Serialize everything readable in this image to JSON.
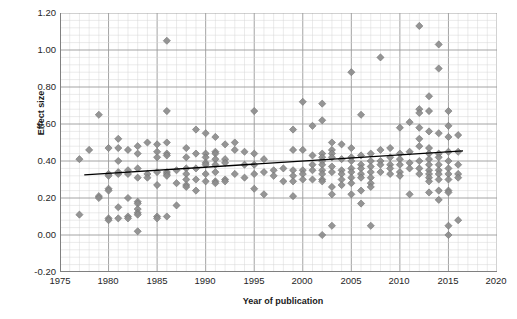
{
  "axes": {
    "x_title": "Year of publication",
    "y_title": "Effect size",
    "x_ticks": [
      "1975",
      "1980",
      "1985",
      "1990",
      "1995",
      "2000",
      "2005",
      "2010",
      "2015",
      "2020"
    ],
    "y_ticks": [
      "1.20",
      "1.00",
      "0.80",
      "0.60",
      "0.40",
      "0.20",
      "0.00",
      "-0.20"
    ]
  },
  "caption": {
    "partial_text": ""
  },
  "style": {
    "marker_color": "#8c8c8c",
    "marker_edge": "#737373",
    "trendline_color": "#000000",
    "major_grid_color": "#9a9a9a",
    "minor_grid_color": "#d6d6d6",
    "axis_color": "#808080"
  },
  "chart_data": {
    "type": "scatter",
    "title": "",
    "xlabel": "Year of publication",
    "ylabel": "Effect size",
    "xlim": [
      1975,
      2020
    ],
    "ylim": [
      -0.2,
      1.2
    ],
    "x_tick_step": 5,
    "y_tick_step": 0.2,
    "minor_grid": true,
    "grid": true,
    "legend": "none",
    "marker": "diamond",
    "series": [
      {
        "name": "Studies",
        "points": [
          [
            1977,
            0.41
          ],
          [
            1977,
            0.11
          ],
          [
            1978,
            0.46
          ],
          [
            1979,
            0.65
          ],
          [
            1979,
            0.21
          ],
          [
            1979,
            0.2
          ],
          [
            1980,
            0.47
          ],
          [
            1980,
            0.33
          ],
          [
            1980,
            0.32
          ],
          [
            1980,
            0.25
          ],
          [
            1980,
            0.24
          ],
          [
            1980,
            0.09
          ],
          [
            1980,
            0.08
          ],
          [
            1981,
            0.52
          ],
          [
            1981,
            0.47
          ],
          [
            1981,
            0.4
          ],
          [
            1981,
            0.34
          ],
          [
            1981,
            0.33
          ],
          [
            1981,
            0.15
          ],
          [
            1981,
            0.09
          ],
          [
            1982,
            0.46
          ],
          [
            1982,
            0.35
          ],
          [
            1982,
            0.33
          ],
          [
            1982,
            0.2
          ],
          [
            1982,
            0.1
          ],
          [
            1982,
            0.09
          ],
          [
            1983,
            0.48
          ],
          [
            1983,
            0.44
          ],
          [
            1983,
            0.36
          ],
          [
            1983,
            0.31
          ],
          [
            1983,
            0.18
          ],
          [
            1983,
            0.17
          ],
          [
            1983,
            0.14
          ],
          [
            1983,
            0.12
          ],
          [
            1983,
            0.11
          ],
          [
            1983,
            0.02
          ],
          [
            1984,
            0.5
          ],
          [
            1984,
            0.33
          ],
          [
            1984,
            0.31
          ],
          [
            1985,
            0.49
          ],
          [
            1985,
            0.45
          ],
          [
            1985,
            0.42
          ],
          [
            1985,
            0.34
          ],
          [
            1985,
            0.27
          ],
          [
            1985,
            0.1
          ],
          [
            1985,
            0.09
          ],
          [
            1986,
            1.05
          ],
          [
            1986,
            0.67
          ],
          [
            1986,
            0.5
          ],
          [
            1986,
            0.44
          ],
          [
            1986,
            0.43
          ],
          [
            1986,
            0.34
          ],
          [
            1986,
            0.33
          ],
          [
            1986,
            0.32
          ],
          [
            1986,
            0.1
          ],
          [
            1987,
            0.35
          ],
          [
            1987,
            0.28
          ],
          [
            1987,
            0.16
          ],
          [
            1988,
            0.47
          ],
          [
            1988,
            0.42
          ],
          [
            1988,
            0.36
          ],
          [
            1988,
            0.33
          ],
          [
            1988,
            0.3
          ],
          [
            1988,
            0.27
          ],
          [
            1988,
            0.26
          ],
          [
            1989,
            0.57
          ],
          [
            1989,
            0.44
          ],
          [
            1989,
            0.36
          ],
          [
            1989,
            0.3
          ],
          [
            1989,
            0.24
          ],
          [
            1990,
            0.55
          ],
          [
            1990,
            0.44
          ],
          [
            1990,
            0.42
          ],
          [
            1990,
            0.39
          ],
          [
            1990,
            0.38
          ],
          [
            1990,
            0.33
          ],
          [
            1990,
            0.29
          ],
          [
            1991,
            0.53
          ],
          [
            1991,
            0.45
          ],
          [
            1991,
            0.44
          ],
          [
            1991,
            0.41
          ],
          [
            1991,
            0.38
          ],
          [
            1991,
            0.34
          ],
          [
            1991,
            0.29
          ],
          [
            1991,
            0.28
          ],
          [
            1992,
            0.49
          ],
          [
            1992,
            0.41
          ],
          [
            1992,
            0.39
          ],
          [
            1992,
            0.3
          ],
          [
            1992,
            0.29
          ],
          [
            1993,
            0.5
          ],
          [
            1993,
            0.46
          ],
          [
            1993,
            0.33
          ],
          [
            1994,
            0.45
          ],
          [
            1994,
            0.38
          ],
          [
            1994,
            0.31
          ],
          [
            1995,
            0.67
          ],
          [
            1995,
            0.44
          ],
          [
            1995,
            0.38
          ],
          [
            1995,
            0.33
          ],
          [
            1995,
            0.25
          ],
          [
            1996,
            0.41
          ],
          [
            1996,
            0.34
          ],
          [
            1996,
            0.22
          ],
          [
            1997,
            0.35
          ],
          [
            1997,
            0.32
          ],
          [
            1998,
            0.36
          ],
          [
            1998,
            0.29
          ],
          [
            1999,
            0.57
          ],
          [
            1999,
            0.46
          ],
          [
            1999,
            0.35
          ],
          [
            1999,
            0.32
          ],
          [
            1999,
            0.29
          ],
          [
            1999,
            0.21
          ],
          [
            2000,
            0.72
          ],
          [
            2000,
            0.46
          ],
          [
            2000,
            0.35
          ],
          [
            2000,
            0.33
          ],
          [
            2000,
            0.3
          ],
          [
            2001,
            0.59
          ],
          [
            2001,
            0.43
          ],
          [
            2001,
            0.38
          ],
          [
            2001,
            0.35
          ],
          [
            2001,
            0.3
          ],
          [
            2002,
            0.71
          ],
          [
            2002,
            0.62
          ],
          [
            2002,
            0.44
          ],
          [
            2002,
            0.42
          ],
          [
            2002,
            0.4
          ],
          [
            2002,
            0.38
          ],
          [
            2002,
            0.35
          ],
          [
            2002,
            0.33
          ],
          [
            2002,
            0.3
          ],
          [
            2002,
            0.29
          ],
          [
            2002,
            0.0
          ],
          [
            2003,
            0.5
          ],
          [
            2003,
            0.46
          ],
          [
            2003,
            0.44
          ],
          [
            2003,
            0.42
          ],
          [
            2003,
            0.37
          ],
          [
            2003,
            0.34
          ],
          [
            2003,
            0.26
          ],
          [
            2003,
            0.22
          ],
          [
            2003,
            0.05
          ],
          [
            2004,
            0.49
          ],
          [
            2004,
            0.41
          ],
          [
            2004,
            0.35
          ],
          [
            2004,
            0.33
          ],
          [
            2004,
            0.3
          ],
          [
            2004,
            0.27
          ],
          [
            2005,
            0.88
          ],
          [
            2005,
            0.47
          ],
          [
            2005,
            0.42
          ],
          [
            2005,
            0.4
          ],
          [
            2005,
            0.36
          ],
          [
            2005,
            0.34
          ],
          [
            2005,
            0.31
          ],
          [
            2005,
            0.28
          ],
          [
            2005,
            0.22
          ],
          [
            2006,
            0.65
          ],
          [
            2006,
            0.43
          ],
          [
            2006,
            0.38
          ],
          [
            2006,
            0.36
          ],
          [
            2006,
            0.33
          ],
          [
            2006,
            0.31
          ],
          [
            2006,
            0.24
          ],
          [
            2006,
            0.17
          ],
          [
            2007,
            0.44
          ],
          [
            2007,
            0.4
          ],
          [
            2007,
            0.37
          ],
          [
            2007,
            0.34
          ],
          [
            2007,
            0.31
          ],
          [
            2007,
            0.28
          ],
          [
            2007,
            0.26
          ],
          [
            2007,
            0.05
          ],
          [
            2008,
            0.96
          ],
          [
            2008,
            0.46
          ],
          [
            2008,
            0.4
          ],
          [
            2008,
            0.38
          ],
          [
            2008,
            0.34
          ],
          [
            2009,
            0.47
          ],
          [
            2009,
            0.42
          ],
          [
            2009,
            0.38
          ],
          [
            2009,
            0.36
          ],
          [
            2009,
            0.33
          ],
          [
            2010,
            0.58
          ],
          [
            2010,
            0.44
          ],
          [
            2010,
            0.41
          ],
          [
            2010,
            0.38
          ],
          [
            2010,
            0.34
          ],
          [
            2010,
            0.32
          ],
          [
            2011,
            0.61
          ],
          [
            2011,
            0.45
          ],
          [
            2011,
            0.39
          ],
          [
            2011,
            0.36
          ],
          [
            2011,
            0.22
          ],
          [
            2012,
            1.13
          ],
          [
            2012,
            0.68
          ],
          [
            2012,
            0.66
          ],
          [
            2012,
            0.58
          ],
          [
            2012,
            0.52
          ],
          [
            2012,
            0.48
          ],
          [
            2012,
            0.4
          ],
          [
            2012,
            0.36
          ],
          [
            2012,
            0.33
          ],
          [
            2013,
            0.75
          ],
          [
            2013,
            0.67
          ],
          [
            2013,
            0.56
          ],
          [
            2013,
            0.47
          ],
          [
            2013,
            0.44
          ],
          [
            2013,
            0.41
          ],
          [
            2013,
            0.38
          ],
          [
            2013,
            0.35
          ],
          [
            2013,
            0.33
          ],
          [
            2013,
            0.31
          ],
          [
            2013,
            0.29
          ],
          [
            2013,
            0.23
          ],
          [
            2014,
            1.03
          ],
          [
            2014,
            0.9
          ],
          [
            2014,
            0.55
          ],
          [
            2014,
            0.44
          ],
          [
            2014,
            0.42
          ],
          [
            2014,
            0.38
          ],
          [
            2014,
            0.35
          ],
          [
            2014,
            0.33
          ],
          [
            2014,
            0.3
          ],
          [
            2014,
            0.24
          ],
          [
            2014,
            0.19
          ],
          [
            2015,
            0.67
          ],
          [
            2015,
            0.59
          ],
          [
            2015,
            0.53
          ],
          [
            2015,
            0.45
          ],
          [
            2015,
            0.4
          ],
          [
            2015,
            0.36
          ],
          [
            2015,
            0.33
          ],
          [
            2015,
            0.3
          ],
          [
            2015,
            0.24
          ],
          [
            2015,
            0.23
          ],
          [
            2015,
            0.05
          ],
          [
            2015,
            0.0
          ],
          [
            2016,
            0.54
          ],
          [
            2016,
            0.45
          ],
          [
            2016,
            0.38
          ],
          [
            2016,
            0.33
          ],
          [
            2016,
            0.31
          ],
          [
            2016,
            0.08
          ]
        ]
      }
    ],
    "trendline": {
      "type": "linear",
      "x_start": 1977.5,
      "y_start": 0.325,
      "x_end": 2016.5,
      "y_end": 0.455
    }
  }
}
